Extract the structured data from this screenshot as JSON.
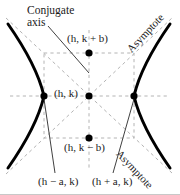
{
  "figure": {
    "type": "hyperbola-diagram",
    "colors": {
      "curve": "#000000",
      "dashed_guide": "#b4b4b4",
      "leader_line": "#2a2a2a",
      "point": "#000000",
      "text": "#1a1a1a",
      "background": "#ffffff",
      "frame": "#c8c8c8"
    }
  },
  "labels": {
    "conjugate_axis_line1": "Conjugate",
    "conjugate_axis_line2": "axis",
    "co_vertex_top": "(h, k + b)",
    "center": "(h, k)",
    "co_vertex_bottom": "(h, k − b)",
    "vertex_left": "(h − a, k)",
    "vertex_right": "(h + a, k)",
    "asymptote_top": "Asymptote",
    "asymptote_bottom": "Asymptote"
  },
  "geometry": {
    "center": {
      "x": 89,
      "y": 96
    },
    "vertex_left": {
      "x": 44,
      "y": 96
    },
    "vertex_right": {
      "x": 134,
      "y": 96
    },
    "co_vertex_top": {
      "x": 89,
      "y": 53
    },
    "co_vertex_bottom": {
      "x": 89,
      "y": 138
    },
    "box": {
      "left": 44,
      "right": 134,
      "top": 53,
      "bottom": 138
    },
    "a": 45,
    "b": 43
  }
}
